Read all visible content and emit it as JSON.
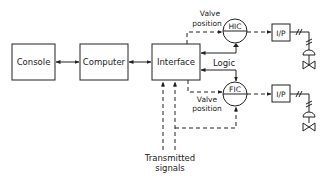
{
  "diagram": {
    "type": "process control block diagram",
    "blocks": {
      "console": "Console",
      "computer": "Computer",
      "interface": "Interface",
      "hic": "HIC",
      "fic": "FIC",
      "ip_top": "I/P",
      "ip_bottom": "I/P"
    },
    "labels": {
      "valve_position_top_1": "Valve",
      "valve_position_top_2": "position",
      "logic": "Logic",
      "valve_position_bottom_1": "Valve",
      "valve_position_bottom_2": "position",
      "transmitted_1": "Transmitted",
      "transmitted_2": "signals"
    },
    "connections": [
      {
        "from": "Console",
        "to": "Computer",
        "style": "solid",
        "direction": "bidirectional"
      },
      {
        "from": "Computer",
        "to": "Interface",
        "style": "solid",
        "direction": "bidirectional"
      },
      {
        "from": "Interface",
        "to": "HIC",
        "style": "dashed",
        "label": "Valve position"
      },
      {
        "from": "HIC",
        "to": "Interface",
        "style": "solid",
        "label": "Logic"
      },
      {
        "from": "Interface",
        "to": "FIC",
        "style": "solid",
        "label": "Logic"
      },
      {
        "from": "Interface",
        "to": "FIC",
        "style": "dashed",
        "label": "Valve position"
      },
      {
        "from": "Transmitted signals",
        "to": "Interface",
        "style": "dashed"
      },
      {
        "from": "Transmitted signals",
        "to": "FIC",
        "style": "dashed"
      },
      {
        "from": "HIC",
        "to": "I/P (top)",
        "style": "dashed"
      },
      {
        "from": "FIC",
        "to": "I/P (bottom)",
        "style": "dashed"
      },
      {
        "from": "I/P (top)",
        "to": "Valve (top)",
        "style": "pneumatic"
      },
      {
        "from": "I/P (bottom)",
        "to": "Valve (bottom)",
        "style": "pneumatic"
      }
    ]
  }
}
